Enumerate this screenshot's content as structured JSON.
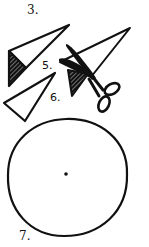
{
  "colors": {
    "ink": "#111111",
    "paper": "#ffffff"
  },
  "steps": [
    {
      "label": "3.",
      "figure": "folded-triangle-with-hatched-corner"
    },
    {
      "label": "5.",
      "figure": "scissors-cutting-folded-triangle"
    },
    {
      "label": "6.",
      "figure": "cut-triangle"
    },
    {
      "label": "7.",
      "figure": "unfolded-circle-with-center-dot"
    }
  ],
  "labels": {
    "step3": "3.",
    "step5": "5.",
    "step6": "6.",
    "step7": "7."
  }
}
